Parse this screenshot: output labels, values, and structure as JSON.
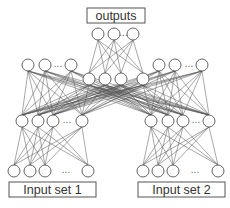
{
  "diagram": {
    "title_box": {
      "label": "outputs"
    },
    "input_boxes": [
      {
        "label": "Input set 1"
      },
      {
        "label": "Input set 2"
      }
    ],
    "ellipsis": "...",
    "layers": {
      "outputs": {
        "y": 34,
        "xs": [
          98,
          114,
          133
        ],
        "ellipsis_x": 123.5
      },
      "left_top_hidden": {
        "y": 65,
        "xs": [
          28,
          45,
          71
        ],
        "ellipsis_x": 58
      },
      "right_top_hidden": {
        "y": 65,
        "xs": [
          159,
          175,
          202
        ],
        "ellipsis_x": 189
      },
      "middle_hidden": {
        "y": 79,
        "xs": [
          89,
          105,
          121,
          143
        ]
      },
      "left_lower_hidden": {
        "y": 121,
        "xs": [
          22,
          38,
          53,
          82
        ],
        "ellipsis_x": 67
      },
      "right_lower_hidden": {
        "y": 121,
        "xs": [
          151,
          168,
          183,
          209
        ],
        "ellipsis_x": 196
      },
      "left_inputs": {
        "y": 171,
        "xs": [
          14,
          30,
          45,
          88
        ],
        "ellipsis_x": 66
      },
      "right_inputs": {
        "y": 171,
        "xs": [
          143,
          158,
          173,
          218
        ],
        "ellipsis_x": 195
      }
    },
    "connections": [
      [
        "outputs",
        "middle_hidden"
      ],
      [
        "left_top_hidden",
        "left_lower_hidden"
      ],
      [
        "right_top_hidden",
        "right_lower_hidden"
      ],
      [
        "middle_hidden",
        "left_lower_hidden"
      ],
      [
        "middle_hidden",
        "right_lower_hidden"
      ],
      [
        "left_top_hidden",
        "right_lower_hidden"
      ],
      [
        "right_top_hidden",
        "left_lower_hidden"
      ],
      [
        "left_lower_hidden",
        "left_inputs"
      ],
      [
        "right_lower_hidden",
        "right_inputs"
      ]
    ],
    "colors": {
      "stroke": "#555555",
      "background": "#ffffff",
      "text": "#333333"
    }
  }
}
